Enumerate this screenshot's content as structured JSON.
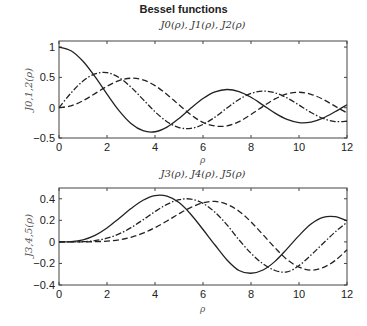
{
  "title": "Bessel functions",
  "chart_data": [
    {
      "type": "line",
      "title": "J0(ρ), J1(ρ), J2(ρ)",
      "xlabel": "ρ",
      "ylabel": "J0,1,2(ρ)",
      "xlim": [
        0,
        12
      ],
      "ylim": [
        -0.5,
        1.1
      ],
      "xticks": [
        0,
        2,
        4,
        6,
        8,
        10,
        12
      ],
      "yticks": [
        -0.5,
        0,
        0.5,
        1
      ],
      "ytick_labels": [
        "−0.5",
        "0",
        "0.5",
        "1"
      ],
      "grid": false,
      "legend": "none",
      "x": [
        0,
        0.5,
        1,
        1.5,
        2,
        2.5,
        3,
        3.5,
        4,
        4.5,
        5,
        5.5,
        6,
        6.5,
        7,
        7.5,
        8,
        8.5,
        9,
        9.5,
        10,
        10.5,
        11,
        11.5,
        12
      ],
      "series": [
        {
          "name": "J0",
          "style": "solid",
          "values": [
            1,
            0.9385,
            0.7652,
            0.5118,
            0.2239,
            -0.0484,
            -0.2601,
            -0.3801,
            -0.3971,
            -0.3205,
            -0.1776,
            -0.0068,
            0.1506,
            0.2601,
            0.3001,
            0.2663,
            0.1717,
            0.0419,
            -0.0903,
            -0.1939,
            -0.2459,
            -0.2366,
            -0.1712,
            -0.0677,
            0.0477
          ]
        },
        {
          "name": "J1",
          "style": "dashdot",
          "values": [
            0,
            0.2423,
            0.4401,
            0.5579,
            0.5767,
            0.4971,
            0.3391,
            0.1374,
            -0.066,
            -0.2311,
            -0.3276,
            -0.3414,
            -0.2767,
            -0.1559,
            -0.0047,
            0.1352,
            0.2346,
            0.2731,
            0.2453,
            0.1613,
            0.0435,
            -0.0789,
            -0.1768,
            -0.2284,
            -0.2234
          ]
        },
        {
          "name": "J2",
          "style": "dashed",
          "values": [
            0,
            0.0306,
            0.1149,
            0.2321,
            0.3528,
            0.4461,
            0.4861,
            0.4586,
            0.3641,
            0.2178,
            0.0466,
            -0.1173,
            -0.2429,
            -0.3014,
            -0.3014,
            -0.2303,
            -0.113,
            0.0223,
            0.1448,
            0.2263,
            0.2546,
            0.2216,
            0.139,
            0.025,
            -0.0849
          ]
        }
      ]
    },
    {
      "type": "line",
      "title": "J3(ρ), J4(ρ), J5(ρ)",
      "xlabel": "ρ",
      "ylabel": "J3,4,5(ρ)",
      "xlim": [
        0,
        12
      ],
      "ylim": [
        -0.4,
        0.5
      ],
      "xticks": [
        0,
        2,
        4,
        6,
        8,
        10,
        12
      ],
      "yticks": [
        -0.4,
        -0.2,
        0,
        0.2,
        0.4
      ],
      "ytick_labels": [
        "−0.4",
        "−0.2",
        "0",
        "0.2",
        "0.4"
      ],
      "grid": false,
      "legend": "none",
      "x": [
        0,
        0.5,
        1,
        1.5,
        2,
        2.5,
        3,
        3.5,
        4,
        4.5,
        5,
        5.5,
        6,
        6.5,
        7,
        7.5,
        8,
        8.5,
        9,
        9.5,
        10,
        10.5,
        11,
        11.5,
        12
      ],
      "series": [
        {
          "name": "J3",
          "style": "solid",
          "values": [
            0,
            0.0026,
            0.0196,
            0.061,
            0.1289,
            0.218,
            0.3091,
            0.3868,
            0.4302,
            0.4247,
            0.3648,
            0.2543,
            0.1148,
            -0.029,
            -0.1676,
            -0.2655,
            -0.2911,
            -0.2608,
            -0.1809,
            -0.0645,
            0.0584,
            0.1655,
            0.2273,
            0.234,
            0.1951
          ]
        },
        {
          "name": "J4",
          "style": "dashdot",
          "values": [
            0,
            0.0002,
            0.0025,
            0.0118,
            0.034,
            0.0738,
            0.132,
            0.2044,
            0.2811,
            0.3484,
            0.3912,
            0.3975,
            0.3576,
            0.2748,
            0.1578,
            0.019,
            -0.1054,
            -0.2029,
            -0.2654,
            -0.2786,
            -0.2196,
            -0.1224,
            -0.015,
            0.0904,
            0.1825
          ]
        },
        {
          "name": "J5",
          "style": "dashed",
          "values": [
            0,
            0,
            0.0002,
            0.0018,
            0.007,
            0.0195,
            0.043,
            0.0806,
            0.1321,
            0.1943,
            0.2611,
            0.3209,
            0.3621,
            0.3754,
            0.3479,
            0.2851,
            0.1858,
            0.0664,
            -0.055,
            -0.1633,
            -0.2341,
            -0.2623,
            -0.2383,
            -0.174,
            -0.0735
          ]
        }
      ]
    }
  ]
}
